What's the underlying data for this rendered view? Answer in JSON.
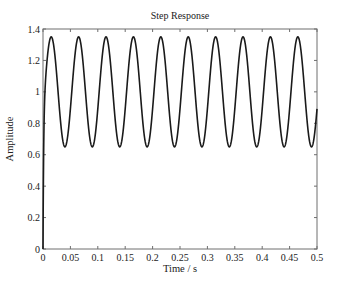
{
  "chart_data": {
    "type": "line",
    "title": "Step Response",
    "xlabel": "Time / s",
    "ylabel": "Amplitude",
    "xlim": [
      0,
      0.5
    ],
    "ylim": [
      0,
      1.4
    ],
    "xticks": [
      0,
      0.05,
      0.1,
      0.15,
      0.2,
      0.25,
      0.3,
      0.35,
      0.4,
      0.45,
      0.5
    ],
    "xtick_labels": [
      "0",
      "0.05",
      "0.1",
      "0.15",
      "0.2",
      "0.25",
      "0.3",
      "0.35",
      "0.4",
      "0.45",
      "0.5"
    ],
    "yticks": [
      0,
      0.2,
      0.4,
      0.6,
      0.8,
      1.0,
      1.2,
      1.4
    ],
    "ytick_labels": [
      "0",
      "0.2",
      "0.4",
      "0.6",
      "0.8",
      "1",
      "1.2",
      "1.4"
    ],
    "grid": false,
    "legend": null,
    "series": [
      {
        "name": "Step Response",
        "color": "#1a1a1a",
        "description": "Undamped oscillation about steady-state 1.0 after near-instant rise from 0",
        "steady_state": 1.0,
        "peak_value": 1.35,
        "trough_value": 0.65,
        "period_s": 0.05,
        "first_peak_time_s": 0.015,
        "peak_times_s": [
          0.015,
          0.065,
          0.115,
          0.165,
          0.215,
          0.265,
          0.315,
          0.365,
          0.415,
          0.465
        ],
        "trough_times_s": [
          0.04,
          0.09,
          0.14,
          0.19,
          0.24,
          0.29,
          0.34,
          0.39,
          0.44,
          0.49
        ],
        "x": [
          0,
          0.002,
          0.005,
          0.01,
          0.015,
          0.02,
          0.03,
          0.04,
          0.05,
          0.065,
          0.09,
          0.115,
          0.14,
          0.165,
          0.19,
          0.215,
          0.24,
          0.265,
          0.29,
          0.315,
          0.34,
          0.365,
          0.39,
          0.415,
          0.44,
          0.465,
          0.49,
          0.5
        ],
        "y": [
          0,
          0.85,
          1.12,
          1.31,
          1.35,
          1.31,
          1.0,
          0.65,
          0.89,
          1.35,
          0.65,
          1.35,
          0.65,
          1.35,
          0.65,
          1.35,
          0.65,
          1.35,
          0.65,
          1.35,
          0.65,
          1.35,
          0.65,
          1.35,
          0.65,
          1.35,
          0.65,
          0.89
        ]
      }
    ],
    "model": {
      "formula": "y = 1 - 0.35*cos(w*t + phi) - (1 - 0.35*cos(phi))*exp(-t/tau)",
      "w": 125.66,
      "phi": 1.257,
      "tau": 0.0012
    }
  },
  "style": {
    "line_color": "#1a1a1a",
    "axis_color": "#6e6e6e",
    "text_color": "#222222",
    "background": "#ffffff"
  }
}
